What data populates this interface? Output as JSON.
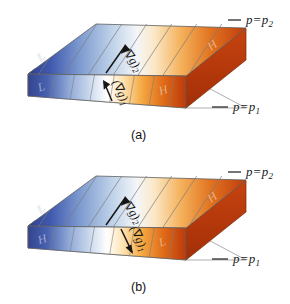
{
  "figure": {
    "type": "two-panel schematic",
    "panels": [
      {
        "id": "a",
        "caption": "(a)",
        "top_isobar_label": {
          "var": "p",
          "eq": "=",
          "value": "p",
          "sub": "2"
        },
        "bottom_isobar_label": {
          "var": "p",
          "eq": "=",
          "value": "p",
          "sub": "1"
        },
        "top_face": {
          "gradient_label": {
            "open": "(",
            "nabla": "∇",
            "g": "g",
            "close": ")",
            "sub": "2"
          },
          "arrow_direction": "up-right",
          "left_letter": "L",
          "right_letter": "H",
          "gradient_from": "#3a52a4",
          "gradient_mid": "#ffffff",
          "gradient_to": "#cf4a12"
        },
        "front_face": {
          "gradient_label": {
            "open": "(",
            "nabla": "∇",
            "g": "g",
            "close": ")",
            "sub": "1"
          },
          "arrow_direction": "up-right",
          "left_letter": "L",
          "right_letter": "H",
          "gradient_from": "#3a52a4",
          "gradient_mid": "#ffffff",
          "gradient_to": "#cf4a12"
        }
      },
      {
        "id": "b",
        "caption": "(b)",
        "top_isobar_label": {
          "var": "p",
          "eq": "=",
          "value": "p",
          "sub": "2"
        },
        "bottom_isobar_label": {
          "var": "p",
          "eq": "=",
          "value": "p",
          "sub": "1"
        },
        "top_face": {
          "gradient_label": {
            "open": "(",
            "nabla": "∇",
            "g": "g",
            "close": ")",
            "sub": "2"
          },
          "arrow_direction": "up-right",
          "left_letter": "L",
          "right_letter": "H",
          "gradient_from": "#3a52a4",
          "gradient_mid": "#ffffff",
          "gradient_to": "#cf4a12"
        },
        "front_face": {
          "gradient_label": {
            "open": "(",
            "nabla": "∇",
            "g": "g",
            "close": ")",
            "sub": "1"
          },
          "arrow_direction": "down-left",
          "left_letter": "H",
          "right_letter": "L",
          "gradient_from": "#3a52a4",
          "gradient_mid": "#ffffff",
          "gradient_to": "#cf4a12"
        }
      }
    ],
    "colors": {
      "cold": "#3a52a4",
      "neutral": "#ffffff",
      "warm": "#cf4a12",
      "outline": "#6b6b6b",
      "band_line": "#8a8a8a",
      "text": "#1a1a1a",
      "background": "#ffffff"
    }
  }
}
